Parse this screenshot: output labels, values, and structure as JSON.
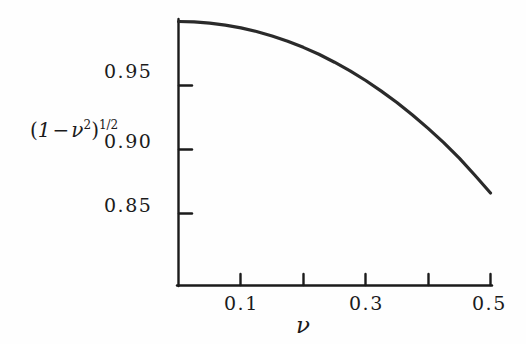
{
  "chart_data": {
    "type": "line",
    "title": "",
    "xlabel": "ν",
    "ylabel": "(1 − ν²)^(1/2)",
    "xlim": [
      0.0,
      0.5
    ],
    "ylim": [
      0.83,
      1.0
    ],
    "grid": false,
    "legend": "none",
    "x_tick_values": [
      0.0,
      0.1,
      0.2,
      0.3,
      0.4,
      0.5
    ],
    "x_tick_labels": [
      "",
      "0.1",
      "",
      "0.3",
      "",
      "0.5"
    ],
    "y_tick_values": [
      0.85,
      0.9,
      0.95
    ],
    "y_tick_labels": [
      "0.85",
      "0.90",
      "0.95"
    ],
    "series": [
      {
        "name": "(1 - nu^2)^(1/2)",
        "x": [
          0.0,
          0.025,
          0.05,
          0.075,
          0.1,
          0.125,
          0.15,
          0.175,
          0.2,
          0.225,
          0.25,
          0.275,
          0.3,
          0.325,
          0.35,
          0.375,
          0.4,
          0.425,
          0.45,
          0.475,
          0.5
        ],
        "values": [
          1.0,
          0.9997,
          0.9987,
          0.9972,
          0.995,
          0.9922,
          0.9887,
          0.9846,
          0.9798,
          0.9744,
          0.9682,
          0.9614,
          0.9539,
          0.9456,
          0.9367,
          0.927,
          0.9165,
          0.9054,
          0.8933,
          0.8799,
          0.866
        ]
      }
    ]
  },
  "labels": {
    "y_axis_expression_open": "(",
    "y_axis_expression_one": "1",
    "y_axis_expression_minus": "−",
    "y_axis_expression_nu": "ν",
    "y_axis_expression_sq": "2",
    "y_axis_expression_close": ")",
    "y_axis_expression_exp": "1/2",
    "x_axis_symbol": "ν",
    "tick_y_095": "0.95",
    "tick_y_090": "0.90",
    "tick_y_085": "0.85",
    "tick_x_01": "0.1",
    "tick_x_03": "0.3",
    "tick_x_05": "0.5"
  },
  "colors": {
    "ink": "#1b1b1b",
    "background": "#fefefe",
    "curve": "#2a2a2a"
  }
}
